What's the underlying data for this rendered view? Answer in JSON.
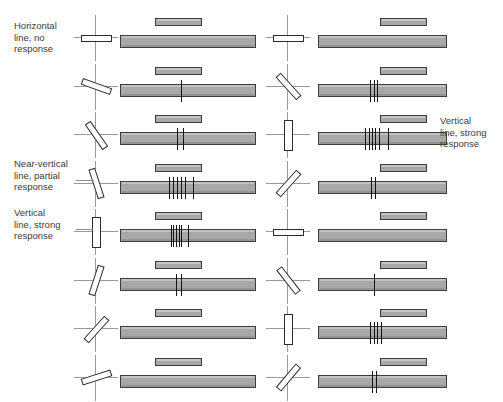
{
  "figure": {
    "colors": {
      "bar_fill": "#a8a8a8",
      "bar_stroke": "#3d3d3d",
      "spike": "#151515",
      "axis": "#9a9a9a",
      "text": "#3b3b3b",
      "background": "#ffffff"
    }
  },
  "annotations": [
    {
      "id": "horizontal-no-response",
      "text": "Horizontal\nline, no\nresponse",
      "side": "left",
      "x": 14,
      "y": 20,
      "leader": {
        "x": 0,
        "y": 0,
        "w": 0,
        "show": false
      }
    },
    {
      "id": "near-vertical-partial-response",
      "text": "Near-vertical\nline, partial\nresponse",
      "side": "left",
      "x": 14,
      "y": 158,
      "leader": {
        "x": 76,
        "y": 180,
        "w": 18,
        "show": true
      }
    },
    {
      "id": "vertical-strong-response-left",
      "text": "Vertical\nline, strong\nresponse",
      "side": "left",
      "x": 14,
      "y": 207,
      "leader": {
        "x": 76,
        "y": 229,
        "w": 17,
        "show": true
      }
    },
    {
      "id": "vertical-strong-response-right",
      "text": "Vertical\nline, strong\nresponse",
      "side": "right",
      "x": 440,
      "y": 115,
      "leader": {
        "x": 0,
        "y": 0,
        "w": 0,
        "show": false
      }
    }
  ],
  "chart_data": {
    "type": "table",
    "xlabel": "Time (spike train record)",
    "ylabel": "Stimulus orientation",
    "legend": [
      "stimulus bar",
      "response record",
      "action potential"
    ],
    "columns": [
      {
        "name": "left-column",
        "x": 0,
        "rows": [
          {
            "index": 1,
            "angle_deg": 0,
            "spike_count": 0,
            "spikes": [],
            "response": "none",
            "label": "Horizontal line, no response"
          },
          {
            "index": 2,
            "angle_deg": -20,
            "spike_count": 1,
            "spikes": [
              45
            ],
            "response": "weak",
            "label": ""
          },
          {
            "index": 3,
            "angle_deg": -55,
            "spike_count": 2,
            "spikes": [
              42,
              46
            ],
            "response": "weak",
            "label": ""
          },
          {
            "index": 4,
            "angle_deg": -72,
            "spike_count": 6,
            "spikes": [
              36,
              39,
              42,
              45,
              48,
              54
            ],
            "response": "partial",
            "label": "Near-vertical line, partial response"
          },
          {
            "index": 5,
            "angle_deg": 90,
            "spike_count": 6,
            "spikes": [
              37,
              39,
              41,
              43,
              45,
              50
            ],
            "response": "strong",
            "label": "Vertical line, strong response"
          },
          {
            "index": 6,
            "angle_deg": 72,
            "spike_count": 2,
            "spikes": [
              41,
              45
            ],
            "response": "weak",
            "label": ""
          },
          {
            "index": 7,
            "angle_deg": 48,
            "spike_count": 0,
            "spikes": [],
            "response": "none",
            "label": ""
          },
          {
            "index": 8,
            "angle_deg": 18,
            "spike_count": 0,
            "spikes": [],
            "response": "none",
            "label": ""
          }
        ]
      },
      {
        "name": "right-column",
        "x": 1,
        "rows": [
          {
            "index": 1,
            "angle_deg": 0,
            "spike_count": 0,
            "spikes": [],
            "response": "none",
            "label": ""
          },
          {
            "index": 2,
            "angle_deg": -48,
            "spike_count": 3,
            "spikes": [
              40,
              43,
              46
            ],
            "response": "weak",
            "label": ""
          },
          {
            "index": 3,
            "angle_deg": 90,
            "spike_count": 6,
            "spikes": [
              36,
              39,
              42,
              44,
              47,
              54
            ],
            "response": "strong",
            "label": "Vertical line, strong response"
          },
          {
            "index": 4,
            "angle_deg": 48,
            "spike_count": 2,
            "spikes": [
              41,
              44
            ],
            "response": "weak",
            "label": ""
          },
          {
            "index": 5,
            "angle_deg": 0,
            "spike_count": 0,
            "spikes": [],
            "response": "none",
            "label": ""
          },
          {
            "index": 6,
            "angle_deg": -52,
            "spike_count": 1,
            "spikes": [
              43
            ],
            "response": "weak",
            "label": ""
          },
          {
            "index": 7,
            "angle_deg": 90,
            "spike_count": 4,
            "spikes": [
              40,
              43,
              46,
              49
            ],
            "response": "strong",
            "label": ""
          },
          {
            "index": 8,
            "angle_deg": 50,
            "spike_count": 2,
            "spikes": [
              42,
              45
            ],
            "response": "weak",
            "label": ""
          }
        ]
      }
    ]
  },
  "layout": {
    "row_height": 48.5,
    "row_top_offset": 14,
    "columns": [
      {
        "icon_x": 72,
        "small_x": 155,
        "small_w": 47,
        "resp_x": 120,
        "resp_w": 136
      },
      {
        "icon_x": 264,
        "small_x": 380,
        "small_w": 47,
        "resp_x": 318,
        "resp_w": 129
      }
    ]
  }
}
